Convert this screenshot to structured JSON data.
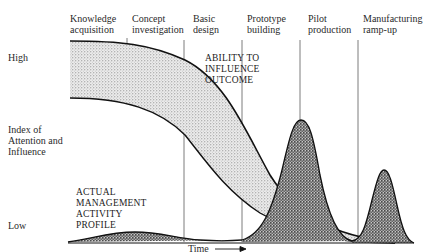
{
  "caption_partial": "",
  "phases": [
    {
      "line1": "Knowledge",
      "line2": "acquisition"
    },
    {
      "line1": "Concept",
      "line2": "investigation"
    },
    {
      "line1": "Basic",
      "line2": "design"
    },
    {
      "line1": "Prototype",
      "line2": "building"
    },
    {
      "line1": "Pilot",
      "line2": "production"
    },
    {
      "line1": "Manufacturing",
      "line2": "ramp-up"
    }
  ],
  "y_axis": {
    "high": "High",
    "title_line1": "Index of",
    "title_line2": "Attention and",
    "title_line3": "Influence",
    "low": "Low"
  },
  "x_axis": {
    "label": "Time",
    "arrow": "→"
  },
  "curves": {
    "ability": {
      "line1": "ABILITY TO",
      "line2": "INFLUENCE",
      "line3": "OUTCOME"
    },
    "activity": {
      "line1": "ACTUAL",
      "line2": "MANAGEMENT",
      "line3": "ACTIVITY",
      "line4": "PROFILE"
    }
  },
  "colors": {
    "ink": "#1a1a1a",
    "light_stipple": "#d6d6d6",
    "dark_stipple": "#8a8a8a",
    "divider": "#555555"
  }
}
